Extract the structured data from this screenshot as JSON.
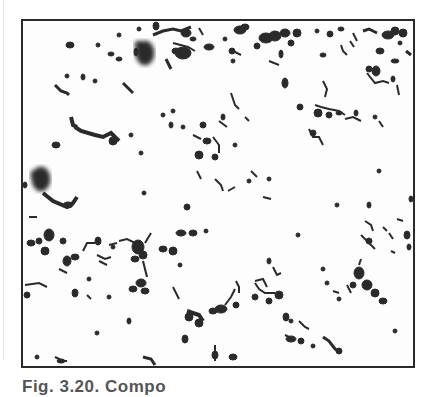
{
  "figure": {
    "type": "micrograph",
    "frame_color": "#2a2a2a",
    "particle_color": "#2b2b2b",
    "background_color": "#fdfdfd"
  },
  "caption": {
    "text": "Fig. 3.20. Compo"
  }
}
